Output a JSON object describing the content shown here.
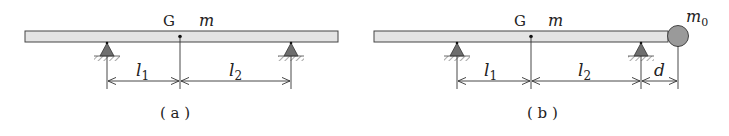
{
  "figures": [
    {
      "id": "a",
      "caption": "( a )",
      "center_label": "G",
      "mass_label": "m",
      "dim_left": "l",
      "dim_left_sub": "1",
      "dim_right": "l",
      "dim_right_sub": "2"
    },
    {
      "id": "b",
      "caption": "( b )",
      "center_label": "G",
      "mass_label": "m",
      "dim_left": "l",
      "dim_left_sub": "1",
      "dim_right": "l",
      "dim_right_sub": "2",
      "dim_extra": "d",
      "end_mass": "m",
      "end_mass_sub": "0"
    }
  ],
  "colors": {
    "beam_fill": "#e4e4e4",
    "beam_stroke": "#444444",
    "support_fill": "#6e6e6e",
    "ball_fill": "#9a9a9a",
    "line": "#333333"
  }
}
